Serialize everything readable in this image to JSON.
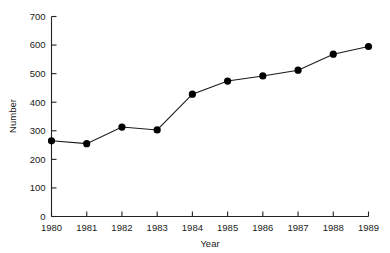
{
  "chart_data": {
    "type": "line",
    "title": "",
    "xlabel": "Year",
    "ylabel": "Number",
    "x": [
      1980,
      1981,
      1982,
      1983,
      1984,
      1985,
      1986,
      1987,
      1988,
      1989
    ],
    "categories": [
      "1980",
      "1981",
      "1982",
      "1983",
      "1984",
      "1985",
      "1986",
      "1987",
      "1988",
      "1989"
    ],
    "values": [
      265,
      255,
      313,
      303,
      428,
      474,
      492,
      512,
      568,
      595
    ],
    "series": [
      {
        "name": "Number",
        "values": [
          265,
          255,
          313,
          303,
          428,
          474,
          492,
          512,
          568,
          595
        ]
      }
    ],
    "ylim": [
      0,
      700
    ],
    "xlim": [
      1980,
      1989
    ],
    "yticks": [
      0,
      100,
      200,
      300,
      400,
      500,
      600,
      700
    ],
    "ytick_labels": [
      "0",
      "100",
      "200",
      "300",
      "400",
      "500",
      "600",
      "700"
    ],
    "xticks": [
      1980,
      1981,
      1982,
      1983,
      1984,
      1985,
      1986,
      1987,
      1988,
      1989
    ],
    "xtick_labels": [
      "1980",
      "1981",
      "1982",
      "1983",
      "1984",
      "1985",
      "1986",
      "1987",
      "1988",
      "1989"
    ],
    "grid": false,
    "legend": false,
    "legend_position": "none",
    "marker": "filled-circle",
    "line_color": "#1a1a1a",
    "marker_color": "#000000",
    "background_color": "#ffffff"
  },
  "axis": {
    "y_title": "Number",
    "x_title": "Year"
  }
}
